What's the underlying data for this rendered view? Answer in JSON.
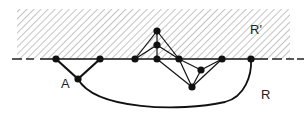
{
  "diagram": {
    "type": "planar-graph-region",
    "labels": {
      "region_upper": "R'",
      "region_lower": "R",
      "vertex_a": "A"
    },
    "colors": {
      "stroke": "#111111",
      "hatch": "#9a9a9a",
      "background": "#ffffff"
    },
    "nodes": [
      {
        "id": "L1",
        "x": 56,
        "y": 59
      },
      {
        "id": "L2",
        "x": 100,
        "y": 59
      },
      {
        "id": "A",
        "x": 78,
        "y": 79
      },
      {
        "id": "P1",
        "x": 135,
        "y": 59
      },
      {
        "id": "Top",
        "x": 157,
        "y": 31
      },
      {
        "id": "Mid",
        "x": 157,
        "y": 45
      },
      {
        "id": "Base",
        "x": 157,
        "y": 59
      },
      {
        "id": "N5",
        "x": 179,
        "y": 59
      },
      {
        "id": "Low",
        "x": 192,
        "y": 87
      },
      {
        "id": "N7",
        "x": 201,
        "y": 70
      },
      {
        "id": "N8",
        "x": 222,
        "y": 59
      },
      {
        "id": "RN",
        "x": 251,
        "y": 59
      }
    ],
    "edges": [
      [
        "L1",
        "A"
      ],
      [
        "A",
        "L2"
      ],
      [
        "P1",
        "Top"
      ],
      [
        "P1",
        "Mid"
      ],
      [
        "Top",
        "Mid"
      ],
      [
        "Mid",
        "Base"
      ],
      [
        "Top",
        "N5"
      ],
      [
        "Mid",
        "N5"
      ],
      [
        "Base",
        "Low"
      ],
      [
        "N5",
        "Low"
      ],
      [
        "N5",
        "N7"
      ],
      [
        "Low",
        "N7"
      ],
      [
        "N7",
        "N8"
      ],
      [
        "Low",
        "N8"
      ]
    ]
  }
}
